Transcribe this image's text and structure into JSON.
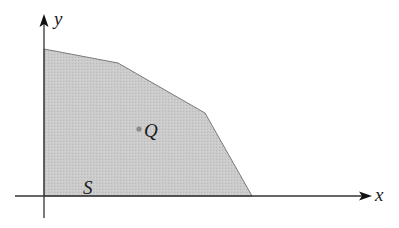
{
  "figure": {
    "axes": {
      "x_label": "x",
      "y_label": "y",
      "origin_px": [
        44,
        196
      ],
      "x_axis_end_px": 370,
      "y_axis_top_px": 15,
      "axis_color": "#333333"
    },
    "region": {
      "label": "S",
      "fill_color": "#c8c8c8",
      "edge_color": "#777777",
      "vertices_px": [
        [
          44,
          49
        ],
        [
          118,
          63
        ],
        [
          205,
          113
        ],
        [
          252,
          196
        ],
        [
          44,
          196
        ]
      ]
    },
    "point": {
      "label": "Q",
      "position_px": [
        139,
        129
      ],
      "color": "#8a8a8a"
    }
  }
}
